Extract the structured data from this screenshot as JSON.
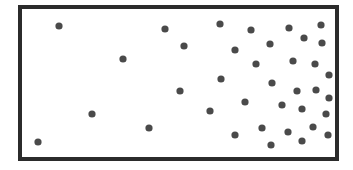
{
  "diagram": {
    "box": {
      "x": 20,
      "y": 7,
      "width": 317,
      "height": 152,
      "stroke": "#2b2b2b",
      "stroke_width": 4
    },
    "particle_color": "#4a4a4a",
    "particle_radius": 3.6,
    "particles": [
      [
        59,
        26
      ],
      [
        165,
        29
      ],
      [
        123,
        59
      ],
      [
        92,
        114
      ],
      [
        149,
        128
      ],
      [
        38,
        142
      ],
      [
        180,
        91
      ],
      [
        220,
        24
      ],
      [
        251,
        30
      ],
      [
        289,
        28
      ],
      [
        321,
        25
      ],
      [
        304,
        38
      ],
      [
        322,
        43
      ],
      [
        184,
        46
      ],
      [
        235,
        50
      ],
      [
        270,
        44
      ],
      [
        256,
        64
      ],
      [
        293,
        61
      ],
      [
        315,
        64
      ],
      [
        329,
        75
      ],
      [
        221,
        79
      ],
      [
        272,
        83
      ],
      [
        297,
        91
      ],
      [
        316,
        90
      ],
      [
        329,
        98
      ],
      [
        245,
        102
      ],
      [
        282,
        105
      ],
      [
        302,
        109
      ],
      [
        326,
        114
      ],
      [
        210,
        111
      ],
      [
        262,
        128
      ],
      [
        288,
        132
      ],
      [
        313,
        127
      ],
      [
        235,
        135
      ],
      [
        328,
        135
      ],
      [
        271,
        145
      ],
      [
        302,
        141
      ]
    ]
  }
}
